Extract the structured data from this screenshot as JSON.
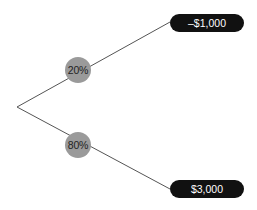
{
  "diagram": {
    "type": "probability-tree",
    "root": {
      "x": 17,
      "y": 107
    },
    "branches": [
      {
        "probability": "20%",
        "outcome": "–$1,000"
      },
      {
        "probability": "80%",
        "outcome": "$3,000"
      }
    ],
    "colors": {
      "line": "#555555",
      "probability_node": "#9a9a9a",
      "outcome_pill": "#111111",
      "outcome_text": "#ffffff"
    }
  }
}
